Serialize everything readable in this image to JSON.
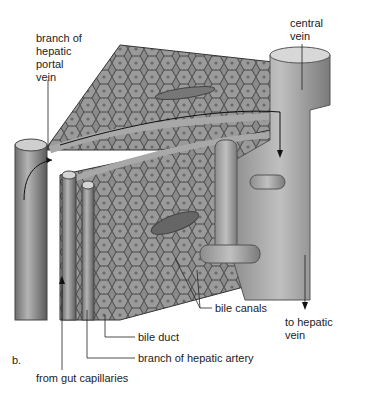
{
  "figure": {
    "panel_label": "b.",
    "labels": {
      "portal_vein": "branch of\nhepatic\nportal\nvein",
      "central_vein": "central\nvein",
      "bile_canals": "bile canals",
      "to_hepatic_vein": "to hepatic\nvein",
      "bile_duct": "bile duct",
      "hepatic_artery": "branch of hepatic artery",
      "gut_capillaries": "from gut capillaries"
    }
  }
}
